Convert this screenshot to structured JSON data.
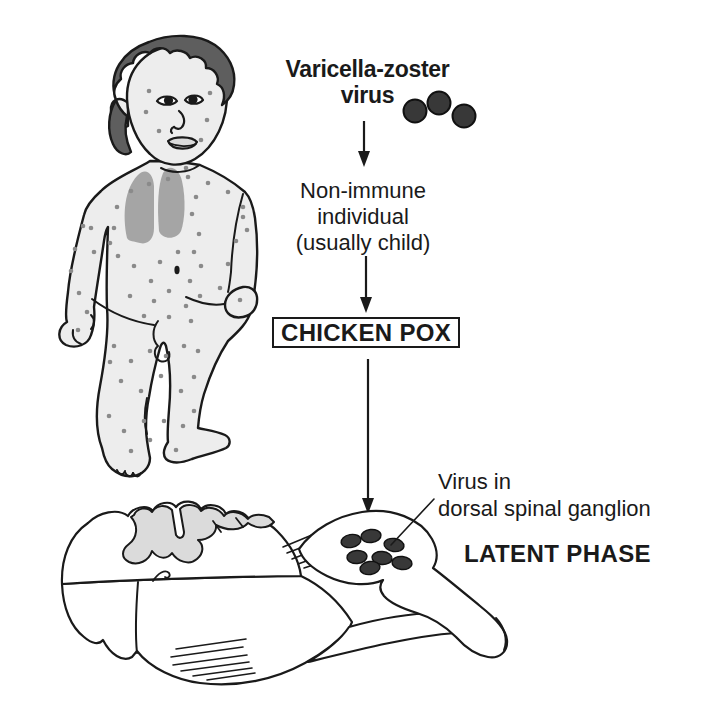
{
  "diagram": {
    "title": {
      "line1": "Varicella-zoster",
      "line2": "virus"
    },
    "flow": {
      "host_line1": "Non-immune",
      "host_line2": "individual",
      "host_line3": "(usually child)",
      "disease_box": "CHICKEN POX",
      "ganglion_label_line1": "Virus in",
      "ganglion_label_line2": "dorsal spinal ganglion",
      "phase_label": "LATENT PHASE"
    },
    "icons": {
      "virus_particles": "three dark round varicella-zoster virus particles",
      "virus_particle_count": 3,
      "ganglion_virus_dots": "virus particles lying latent inside dorsal root ganglion",
      "ganglion_virus_dot_count": 7,
      "child_illustration": "toddler covered in chickenpox spots with lungs shown",
      "spinal_cord_illustration": "spinal cord cross-section with dorsal spinal ganglion and spinal nerve"
    },
    "colors": {
      "ink": "#1a1a1a",
      "skin": "#ededed",
      "hair": "#5e5e5e",
      "lungs": "#a5a5a5",
      "pox_spot": "#8a8a8a",
      "gray_matter": "#dbdbdb",
      "virus_dot": "#383838",
      "lips": "#dcdcdc"
    }
  }
}
